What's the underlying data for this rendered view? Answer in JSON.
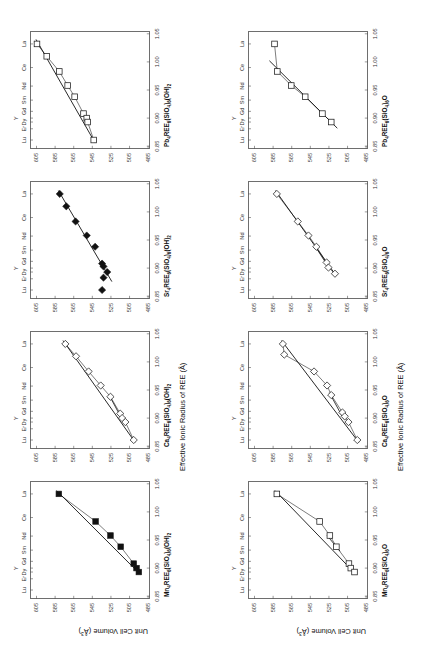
{
  "figure": {
    "rotation_deg": -90,
    "axis_titles": {
      "y": "Unit Cell Volume (Å3)",
      "y_base": "Unit Cell Volume (Å",
      "y_sup": "3",
      "y_tail": ")",
      "x": "Effective Ionic Radius of REE (Å)"
    },
    "axis": {
      "x_ticks": [
        "0.85",
        "0.90",
        "0.95",
        "1.00",
        "1.05"
      ],
      "x_values": [
        0.85,
        0.9,
        0.95,
        1.0,
        1.05
      ],
      "x_range": [
        0.845,
        1.055
      ],
      "y_ticks": [
        "485",
        "505",
        "525",
        "545",
        "565",
        "585",
        "605"
      ],
      "y_values": [
        485,
        505,
        525,
        545,
        565,
        585,
        605
      ],
      "y_range": [
        483,
        612
      ],
      "ree_tick_labels": [
        "Lu",
        "Er",
        "Dy",
        "Y",
        "Gd",
        "Sm",
        "Nd",
        "Ce",
        "La"
      ],
      "ree_tick_radii": [
        0.861,
        0.881,
        0.893,
        0.9,
        0.912,
        0.932,
        0.957,
        0.99,
        1.032
      ]
    },
    "panels_order_note": "row 1 = hydroxyl apatites, row 2 = oxy apatites; columns Mn, Ca, Sr, Pb"
  },
  "chart_data": [
    {
      "id": "mn-hydroxyl",
      "type": "scatter",
      "title": "Mn4REE6(SiO4)6(OH)2",
      "title_parts": [
        "Mn",
        "4",
        "REE",
        "6",
        "(SiO",
        "4",
        ")",
        "6",
        "(OH)",
        "2"
      ],
      "marker": "filled-square",
      "xlabel": "Effective Ionic Radius of REE (Å)",
      "ylabel": "Unit Cell Volume (Å3)",
      "xlim": [
        0.845,
        1.055
      ],
      "ylim": [
        483,
        612
      ],
      "grid": false,
      "points": [
        {
          "ree": "La",
          "x": 1.032,
          "y": 581.0
        },
        {
          "ree": "Nd",
          "x": 0.983,
          "y": 541.5
        },
        {
          "ree": "Sm",
          "x": 0.958,
          "y": 525.5
        },
        {
          "ree": "Gd",
          "x": 0.938,
          "y": 514.5
        },
        {
          "ree": "Dy",
          "x": 0.908,
          "y": 500.5
        },
        {
          "ree": "Y",
          "x": 0.9,
          "y": 497.5
        },
        {
          "ree": "Er",
          "x": 0.893,
          "y": 495.0
        }
      ],
      "fit_line": {
        "x1": 1.038,
        "y1": 583.5,
        "x2": 0.889,
        "y2": 493.5
      }
    },
    {
      "id": "ca-hydroxyl",
      "type": "scatter",
      "title": "Ca4REE6(SiO4)6(OH)2",
      "title_parts": [
        "Ca",
        "4",
        "REE",
        "6",
        "(SiO",
        "4",
        ")",
        "6",
        "(OH)",
        "2"
      ],
      "marker": "open-diamond",
      "xlabel": "Effective Ionic Radius of REE (Å)",
      "ylabel": "Unit Cell Volume (Å3)",
      "xlim": [
        0.845,
        1.055
      ],
      "ylim": [
        483,
        612
      ],
      "grid": false,
      "points": [
        {
          "ree": "La",
          "x": 1.032,
          "y": 574.0
        },
        {
          "ree": "Ce",
          "x": 1.01,
          "y": 562.5
        },
        {
          "ree": "Nd",
          "x": 0.983,
          "y": 549.0
        },
        {
          "ree": "Sm",
          "x": 0.958,
          "y": 536.0
        },
        {
          "ree": "Gd",
          "x": 0.938,
          "y": 525.5
        },
        {
          "ree": "Dy",
          "x": 0.908,
          "y": 515.0
        },
        {
          "ree": "Y",
          "x": 0.9,
          "y": 513.0
        },
        {
          "ree": "Er",
          "x": 0.893,
          "y": 509.5
        },
        {
          "ree": "Lu",
          "x": 0.861,
          "y": 500.5
        }
      ],
      "fit_line": {
        "x1": 1.038,
        "y1": 576.5,
        "x2": 0.857,
        "y2": 499.0
      },
      "second_segment": {
        "x1": 0.938,
        "y1": 526.0,
        "x2": 0.89,
        "y2": 510.5
      }
    },
    {
      "id": "sr-hydroxyl",
      "type": "scatter",
      "title": "Sr4REE6(SiO4)6(OH)2",
      "title_parts": [
        "Sr",
        "4",
        "REE",
        "6",
        "(SiO",
        "4",
        ")",
        "6",
        "(OH)",
        "2"
      ],
      "marker": "filled-diamond",
      "xlabel": "Effective Ionic Radius of REE (Å)",
      "ylabel": "Unit Cell Volume (Å3)",
      "xlim": [
        0.845,
        1.055
      ],
      "ylim": [
        483,
        612
      ],
      "grid": false,
      "points": [
        {
          "ree": "La",
          "x": 1.032,
          "y": 580.0
        },
        {
          "ree": "Ce",
          "x": 1.01,
          "y": 573.0
        },
        {
          "ree": "Nd",
          "x": 0.983,
          "y": 563.0
        },
        {
          "ree": "Sm",
          "x": 0.958,
          "y": 551.0
        },
        {
          "ree": "Gd",
          "x": 0.938,
          "y": 542.0
        },
        {
          "ree": "Dy",
          "x": 0.908,
          "y": 534.5
        },
        {
          "ree": "Y",
          "x": 0.903,
          "y": 533.0
        },
        {
          "ree": "Er",
          "x": 0.893,
          "y": 529.0
        },
        {
          "ree": "Er2",
          "x": 0.883,
          "y": 533.0
        },
        {
          "ree": "Lu",
          "x": 0.861,
          "y": 534.5
        }
      ],
      "fit_line": {
        "x1": 1.038,
        "y1": 581.5,
        "x2": 0.876,
        "y2": 524.0
      }
    },
    {
      "id": "pb-hydroxyl",
      "type": "scatter",
      "title": "Pb4REE6(SiO4)6(OH)2",
      "title_parts": [
        "Pb",
        "4",
        "REE",
        "6",
        "(SiO",
        "4",
        ")",
        "6",
        "(OH)",
        "2"
      ],
      "marker": "open-square",
      "xlabel": "Effective Ionic Radius of REE (Å)",
      "ylabel": "Unit Cell Volume (Å3)",
      "xlim": [
        0.845,
        1.055
      ],
      "ylim": [
        483,
        612
      ],
      "grid": false,
      "points": [
        {
          "ree": "La",
          "x": 1.032,
          "y": 604.5
        },
        {
          "ree": "Ce",
          "x": 1.01,
          "y": 594.0
        },
        {
          "ree": "Nd",
          "x": 0.983,
          "y": 580.5
        },
        {
          "ree": "Sm",
          "x": 0.958,
          "y": 571.5
        },
        {
          "ree": "Gd",
          "x": 0.938,
          "y": 564.0
        },
        {
          "ree": "Dy",
          "x": 0.908,
          "y": 554.5
        },
        {
          "ree": "Y",
          "x": 0.9,
          "y": 551.0
        },
        {
          "ree": "Er",
          "x": 0.893,
          "y": 550.0
        },
        {
          "ree": "Lu",
          "x": 0.861,
          "y": 543.5
        }
      ],
      "fit_line": {
        "x1": 1.04,
        "y1": 605.5,
        "x2": 0.856,
        "y2": 542.0
      }
    },
    {
      "id": "mn-oxy",
      "type": "scatter",
      "title": "Mn4REE6(SiO4)6O",
      "title_parts": [
        "Mn",
        "4",
        "REE",
        "6",
        "(SiO",
        "4",
        ")",
        "6",
        "O",
        ""
      ],
      "marker": "open-square",
      "xlabel": "Effective Ionic Radius of REE (Å)",
      "ylabel": "Unit Cell Volume (Å3)",
      "xlim": [
        0.845,
        1.055
      ],
      "ylim": [
        483,
        612
      ],
      "grid": false,
      "points": [
        {
          "ree": "La",
          "x": 1.032,
          "y": 581.0
        },
        {
          "ree": "Nd",
          "x": 0.983,
          "y": 535.0
        },
        {
          "ree": "Sm",
          "x": 0.958,
          "y": 524.0
        },
        {
          "ree": "Gd",
          "x": 0.938,
          "y": 517.0
        },
        {
          "ree": "Dy",
          "x": 0.908,
          "y": 503.5
        },
        {
          "ree": "Y",
          "x": 0.9,
          "y": 501.5
        },
        {
          "ree": "Er",
          "x": 0.893,
          "y": 497.5
        }
      ],
      "fit_line": {
        "x1": 1.038,
        "y1": 583.0,
        "x2": 0.889,
        "y2": 496.0
      },
      "second_segment": {
        "x1": 0.958,
        "y1": 527.0,
        "x2": 0.93,
        "y2": 513.0
      }
    },
    {
      "id": "ca-oxy",
      "type": "scatter",
      "title": "Ca4REE6(SiO4)6O",
      "title_parts": [
        "Ca",
        "4",
        "REE",
        "6",
        "(SiO",
        "4",
        ")",
        "6",
        "O",
        ""
      ],
      "marker": "open-diamond",
      "xlabel": "Effective Ionic Radius of REE (Å)",
      "ylabel": "Unit Cell Volume (Å3)",
      "xlim": [
        0.845,
        1.055
      ],
      "ylim": [
        483,
        612
      ],
      "grid": false,
      "points": [
        {
          "ree": "La",
          "x": 1.032,
          "y": 574.5
        },
        {
          "ree": "Ce",
          "x": 1.013,
          "y": 573.0
        },
        {
          "ree": "Nd",
          "x": 0.983,
          "y": 541.0
        },
        {
          "ree": "Sm",
          "x": 0.958,
          "y": 527.0
        },
        {
          "ree": "Gd",
          "x": 0.941,
          "y": 522.5
        },
        {
          "ree": "Dy",
          "x": 0.91,
          "y": 510.5
        },
        {
          "ree": "Y",
          "x": 0.903,
          "y": 508.0
        },
        {
          "ree": "Er",
          "x": 0.893,
          "y": 504.0
        },
        {
          "ree": "Lu",
          "x": 0.861,
          "y": 494.5
        }
      ],
      "fit_line": {
        "x1": 1.038,
        "y1": 576.0,
        "x2": 0.857,
        "y2": 493.0
      },
      "second_segment": {
        "x1": 0.945,
        "y1": 524.5,
        "x2": 0.898,
        "y2": 509.0
      }
    },
    {
      "id": "sr-oxy",
      "type": "scatter",
      "title": "Sr4REE6(SiO4)6O",
      "title_parts": [
        "Sr",
        "4",
        "REE",
        "6",
        "(SiO",
        "4",
        ")",
        "6",
        "O",
        ""
      ],
      "marker": "open-diamond",
      "xlabel": "Effective Ionic Radius of REE (Å)",
      "ylabel": "Unit Cell Volume (Å3)",
      "xlim": [
        0.845,
        1.055
      ],
      "ylim": [
        483,
        612
      ],
      "grid": false,
      "points": [
        {
          "ree": "La",
          "x": 1.032,
          "y": 581.0
        },
        {
          "ree": "Nd",
          "x": 0.983,
          "y": 558.5
        },
        {
          "ree": "Sm",
          "x": 0.958,
          "y": 547.0
        },
        {
          "ree": "Gd",
          "x": 0.938,
          "y": 538.5
        },
        {
          "ree": "Dy",
          "x": 0.91,
          "y": 527.5
        },
        {
          "ree": "Y",
          "x": 0.901,
          "y": 525.5
        },
        {
          "ree": "Er",
          "x": 0.89,
          "y": 518.5
        }
      ],
      "fit_line": {
        "x1": 1.038,
        "y1": 582.5,
        "x2": 0.886,
        "y2": 517.0
      },
      "second_segment": {
        "x1": 0.938,
        "y1": 539.5,
        "x2": 0.898,
        "y2": 524.0
      }
    },
    {
      "id": "pb-oxy",
      "type": "scatter",
      "title": "Pb4REE6(SiO4)6O",
      "title_parts": [
        "Pb",
        "4",
        "REE",
        "6",
        "(SiO",
        "4",
        ")",
        "6",
        "O",
        ""
      ],
      "marker": "open-square",
      "xlabel": "Effective Ionic Radius of REE (Å)",
      "ylabel": "Unit Cell Volume (Å3)",
      "xlim": [
        0.845,
        1.055
      ],
      "ylim": [
        483,
        612
      ],
      "grid": false,
      "points": [
        {
          "ree": "La",
          "x": 1.032,
          "y": 583.5
        },
        {
          "ree": "Nd",
          "x": 0.983,
          "y": 580.5
        },
        {
          "ree": "Sm",
          "x": 0.958,
          "y": 565.5
        },
        {
          "ree": "Gd",
          "x": 0.938,
          "y": 550.5
        },
        {
          "ree": "Dy",
          "x": 0.908,
          "y": 532.0
        },
        {
          "ree": "Er",
          "x": 0.893,
          "y": 522.5
        }
      ],
      "fit_line": {
        "x1": 1.002,
        "y1": 589.0,
        "x2": 0.882,
        "y2": 516.0
      }
    }
  ]
}
